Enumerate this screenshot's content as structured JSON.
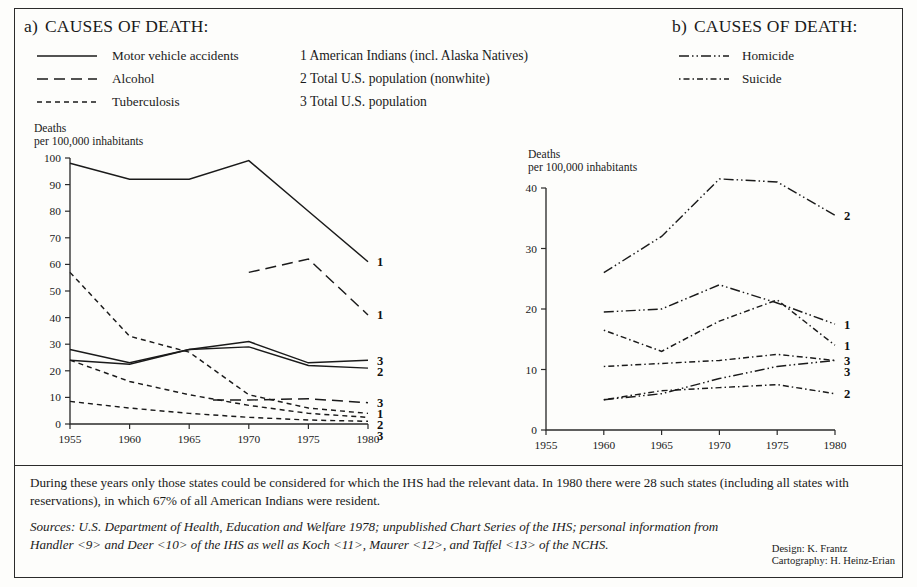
{
  "panel_a": {
    "prefix": "a)",
    "title": "CAUSES OF DEATH:",
    "legend": [
      {
        "label": "Motor vehicle accidents",
        "style": "solid"
      },
      {
        "label": "Alcohol",
        "style": "dashed-long"
      },
      {
        "label": "Tuberculosis",
        "style": "dashed-short"
      }
    ],
    "y_axis_title_line1": "Deaths",
    "y_axis_title_line2": "per 100,000 inhabitants",
    "y_ticks": [
      "0",
      "10",
      "20",
      "30",
      "40",
      "50",
      "60",
      "70",
      "80",
      "90",
      "100"
    ],
    "x_ticks": [
      "1955",
      "1960",
      "1965",
      "1970",
      "1975",
      "1980"
    ]
  },
  "panel_b": {
    "prefix": "b)",
    "title": "CAUSES OF DEATH:",
    "legend": [
      {
        "label": "Homicide",
        "style": "dash-dot-dot"
      },
      {
        "label": "Suicide",
        "style": "dash-dot"
      }
    ],
    "y_axis_title_line1": "Deaths",
    "y_axis_title_line2": "per 100,000 inhabitants",
    "y_ticks": [
      "0",
      "10",
      "20",
      "30",
      "40"
    ],
    "x_ticks": [
      "1955",
      "1960",
      "1965",
      "1970",
      "1975",
      "1980"
    ]
  },
  "key": [
    "1 American Indians (incl. Alaska Natives)",
    "2 Total U.S. population (nonwhite)",
    "3 Total U.S. population"
  ],
  "note": "During these years only those states could be considered for which the IHS had the relevant data. In 1980 there were 28 such states (including all states with reservations), in which 67% of all American Indians were resident.",
  "sources": "Sources: U.S. Department of Health, Education and Welfare 1978; unpublished Chart Series of the IHS; personal information from Handler <9> and Deer <10> of the IHS as well as Koch <11>, Maurer <12>, and Taffel <13> of the NCHS.",
  "credits": {
    "design": "Design: K. Frantz",
    "cartography": "Cartography: H. Heinz-Erian"
  },
  "colors": {
    "ink": "#1a1a1a",
    "frame": "#2b2b2b",
    "background": "#fdfdfb"
  },
  "chart_data": [
    {
      "type": "line",
      "id": "panel_a",
      "title": "CAUSES OF DEATH: Motor vehicle accidents, Alcohol, Tuberculosis",
      "xlabel": "",
      "ylabel": "Deaths per 100,000 inhabitants",
      "x": [
        1955,
        1960,
        1965,
        1970,
        1975,
        1980
      ],
      "xlim": [
        1955,
        1980
      ],
      "ylim": [
        0,
        100
      ],
      "grid": false,
      "legend_position": "top-left",
      "series": [
        {
          "name": "Motor vehicle accidents - American Indians",
          "cause": "Motor vehicle accidents",
          "style": "solid",
          "group": "1",
          "end_label": "1",
          "x": [
            1955,
            1960,
            1965,
            1970,
            1975,
            1980
          ],
          "values": [
            98,
            92,
            92,
            99,
            80,
            61
          ]
        },
        {
          "name": "Motor vehicle accidents - Total U.S. population",
          "cause": "Motor vehicle accidents",
          "style": "solid",
          "group": "3",
          "end_label": "3",
          "x": [
            1955,
            1960,
            1965,
            1970,
            1975,
            1980
          ],
          "values": [
            28,
            23,
            28,
            31,
            23,
            24
          ]
        },
        {
          "name": "Motor vehicle accidents - Total U.S. population (nonwhite)",
          "cause": "Motor vehicle accidents",
          "style": "solid",
          "group": "2",
          "end_label": "2",
          "x": [
            1955,
            1960,
            1965,
            1970,
            1975,
            1980
          ],
          "values": [
            24,
            22.5,
            28,
            29,
            22,
            21
          ]
        },
        {
          "name": "Alcohol - American Indians",
          "cause": "Alcohol",
          "style": "dashed-long",
          "group": "1",
          "end_label": "1",
          "x": [
            1970,
            1975,
            1980
          ],
          "values": [
            57,
            62,
            41
          ]
        },
        {
          "name": "Alcohol - Total U.S. population",
          "cause": "Alcohol",
          "style": "dashed-long",
          "group": "3",
          "end_label": "3",
          "x": [
            1967,
            1970,
            1975,
            1980
          ],
          "values": [
            9,
            9,
            9.5,
            8
          ]
        },
        {
          "name": "Tuberculosis - American Indians",
          "cause": "Tuberculosis",
          "style": "dashed-short",
          "group": "1",
          "end_label": "1",
          "x": [
            1955,
            1960,
            1965,
            1970,
            1975,
            1980
          ],
          "values": [
            57,
            33,
            27,
            11,
            6,
            4
          ]
        },
        {
          "name": "Tuberculosis - Total U.S. population (nonwhite)",
          "cause": "Tuberculosis",
          "style": "dashed-short",
          "group": "2",
          "end_label": "2",
          "x": [
            1955,
            1960,
            1965,
            1970,
            1975,
            1980
          ],
          "values": [
            24,
            16,
            11,
            7,
            4,
            2.5
          ]
        },
        {
          "name": "Tuberculosis - Total U.S. population",
          "cause": "Tuberculosis",
          "style": "dashed-short",
          "group": "3",
          "end_label": "3",
          "x": [
            1955,
            1960,
            1965,
            1970,
            1975,
            1980
          ],
          "values": [
            8.5,
            6,
            4,
            2.5,
            1.5,
            1
          ]
        }
      ]
    },
    {
      "type": "line",
      "id": "panel_b",
      "title": "CAUSES OF DEATH: Homicide, Suicide",
      "xlabel": "",
      "ylabel": "Deaths per 100,000 inhabitants",
      "x": [
        1960,
        1965,
        1970,
        1975,
        1980
      ],
      "xlim": [
        1955,
        1980
      ],
      "ylim": [
        0,
        40
      ],
      "grid": false,
      "legend_position": "top-right",
      "series": [
        {
          "name": "Homicide - Total U.S. population (nonwhite)",
          "cause": "Homicide",
          "style": "dash-dot-dot",
          "group": "2",
          "end_label": "2",
          "x": [
            1960,
            1965,
            1970,
            1975,
            1980
          ],
          "values": [
            26,
            32,
            41.5,
            41,
            35.5
          ]
        },
        {
          "name": "Homicide - American Indians",
          "cause": "Homicide",
          "style": "dash-dot-dot",
          "group": "1",
          "end_label": "1",
          "x": [
            1960,
            1965,
            1970,
            1975,
            1980
          ],
          "values": [
            19.5,
            20,
            24,
            21,
            17.5
          ]
        },
        {
          "name": "Homicide - Total U.S. population",
          "cause": "Homicide",
          "style": "dash-dot-dot",
          "group": "3",
          "end_label": "3",
          "x": [
            1960,
            1965,
            1970,
            1975,
            1980
          ],
          "values": [
            5,
            6,
            8.5,
            10.5,
            11.5
          ]
        },
        {
          "name": "Suicide - American Indians",
          "cause": "Suicide",
          "style": "dash-dot",
          "group": "1",
          "end_label": "1",
          "x": [
            1960,
            1965,
            1970,
            1975,
            1980
          ],
          "values": [
            16.5,
            13,
            18,
            21.5,
            14
          ]
        },
        {
          "name": "Suicide - Total U.S. population",
          "cause": "Suicide",
          "style": "dash-dot",
          "group": "3",
          "end_label": "3",
          "x": [
            1960,
            1965,
            1970,
            1975,
            1980
          ],
          "values": [
            10.5,
            11,
            11.5,
            12.5,
            11.5
          ]
        },
        {
          "name": "Suicide - Total U.S. population (nonwhite)",
          "cause": "Suicide",
          "style": "dash-dot",
          "group": "2",
          "end_label": "2",
          "x": [
            1960,
            1965,
            1970,
            1975,
            1980
          ],
          "values": [
            5,
            6.5,
            7,
            7.5,
            6
          ]
        }
      ]
    }
  ]
}
